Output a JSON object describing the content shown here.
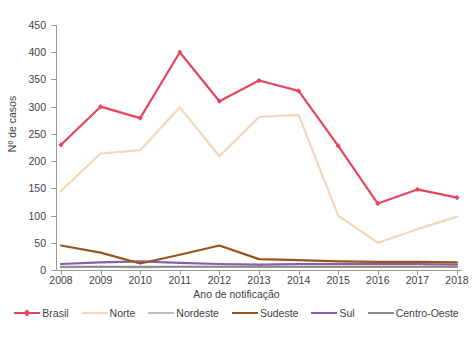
{
  "chart_data": {
    "type": "line",
    "title": "",
    "xlabel": "Ano de notificação",
    "ylabel": "Nº de casos",
    "x": [
      2008,
      2009,
      2010,
      2011,
      2012,
      2013,
      2014,
      2015,
      2016,
      2017,
      2018
    ],
    "xticklabels": [
      "2008",
      "2009",
      "2010",
      "2011",
      "2012",
      "2013",
      "2014",
      "2015",
      "2016",
      "2017",
      "2018"
    ],
    "yticklabels": [
      "0",
      "50",
      "100",
      "150",
      "200",
      "250",
      "300",
      "350",
      "400",
      "450"
    ],
    "ylim": [
      0,
      450
    ],
    "ytick_step": 50,
    "grid": false,
    "legend_position": "bottom",
    "series": [
      {
        "name": "Brasil",
        "color": "#E8445F",
        "marker": "diamond",
        "width": 2.2,
        "values": [
          230,
          300,
          279,
          400,
          310,
          348,
          329,
          228,
          122,
          148,
          133
        ]
      },
      {
        "name": "Norte",
        "color": "#F6D6B8",
        "marker": "none",
        "width": 2.2,
        "values": [
          145,
          214,
          220,
          299,
          209,
          281,
          285,
          100,
          50,
          75,
          98
        ]
      },
      {
        "name": "Nordeste",
        "color": "#BFBFBF",
        "marker": "none",
        "width": 2.2,
        "values": [
          5,
          6,
          5,
          6,
          6,
          6,
          6,
          6,
          6,
          6,
          6
        ]
      },
      {
        "name": "Sudeste",
        "color": "#99541A",
        "marker": "none",
        "width": 2.2,
        "values": [
          45,
          32,
          12,
          28,
          45,
          20,
          18,
          16,
          15,
          15,
          14
        ]
      },
      {
        "name": "Sul",
        "color": "#8A5FA8",
        "marker": "none",
        "width": 2.2,
        "values": [
          11,
          14,
          16,
          13,
          11,
          10,
          11,
          11,
          11,
          11,
          10
        ]
      },
      {
        "name": "Centro-Oeste",
        "color": "#8C8C8C",
        "marker": "none",
        "width": 2.2,
        "values": [
          6,
          6,
          6,
          6,
          6,
          6,
          6,
          6,
          6,
          6,
          6
        ]
      }
    ]
  },
  "legend": {
    "items": [
      {
        "label": "Brasil"
      },
      {
        "label": "Norte"
      },
      {
        "label": "Nordeste"
      },
      {
        "label": "Sudeste"
      },
      {
        "label": "Sul"
      },
      {
        "label": "Centro-Oeste"
      }
    ]
  },
  "caption": {
    "text": ""
  }
}
